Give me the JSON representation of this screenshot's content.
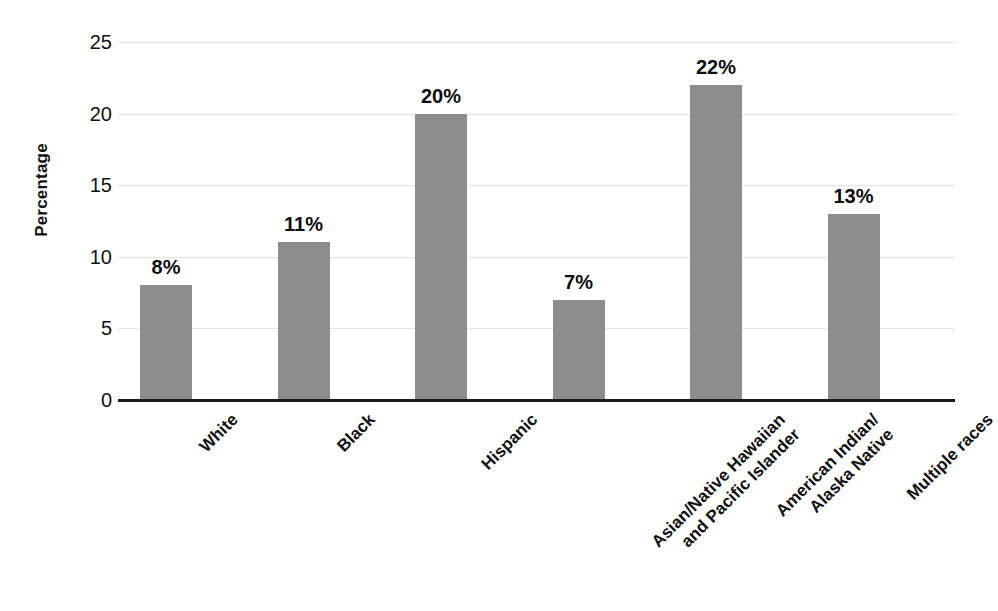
{
  "chart_data": {
    "type": "bar",
    "title": "",
    "subtitle": "",
    "xlabel": "",
    "ylabel": "Percentage",
    "ylim": [
      0,
      25
    ],
    "ytick_values": [
      0,
      5,
      10,
      15,
      20,
      25
    ],
    "ytick_labels": [
      "0",
      "5",
      "10",
      "15",
      "20",
      "25"
    ],
    "grid": true,
    "legend": "none",
    "value_label_suffix": "%",
    "categories": [
      "White",
      "Black",
      "Hispanic",
      "Asian/Native Hawaiian and Pacific Islander",
      "American Indian/ Alaska Native",
      "Multiple races"
    ],
    "category_label_lines": [
      [
        "White"
      ],
      [
        "Black"
      ],
      [
        "Hispanic"
      ],
      [
        "Asian/Native Hawaiian",
        "and Pacific Islander"
      ],
      [
        "American Indian/",
        "Alaska Native"
      ],
      [
        "Multiple races"
      ]
    ],
    "values": [
      8,
      11,
      20,
      7,
      22,
      13
    ],
    "value_labels": [
      "8%",
      "11%",
      "20%",
      "7%",
      "22%",
      "13%"
    ],
    "colors": {
      "bar_fill": "#8d8d8d",
      "axis_line": "#1a1a1a",
      "gridline": "#e3e3e3",
      "text": "#111111",
      "background": "#ffffff"
    }
  }
}
